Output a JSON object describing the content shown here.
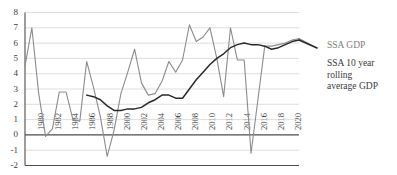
{
  "chart_data": {
    "type": "line",
    "title": "",
    "xlabel": "",
    "ylabel": "",
    "ylim": [
      -2,
      8
    ],
    "ytick_step": 1,
    "yticks": [
      8,
      7,
      6,
      5,
      4,
      3,
      2,
      1,
      0,
      -1,
      -2
    ],
    "xlim": [
      1980,
      2020
    ],
    "grid": true,
    "grid_axis": "y",
    "legend_position": "right",
    "x": [
      1980,
      1981,
      1982,
      1983,
      1984,
      1985,
      1986,
      1987,
      1988,
      1989,
      1990,
      1991,
      1992,
      1993,
      1994,
      1995,
      1996,
      1997,
      1998,
      1999,
      2000,
      2001,
      2002,
      2003,
      2004,
      2005,
      2006,
      2007,
      2008,
      2009,
      2010,
      2011,
      2012,
      2013,
      2014,
      2015,
      2016,
      2017,
      2018,
      2019,
      2020
    ],
    "xticks": [
      1980,
      1982,
      1984,
      1986,
      1988,
      2000,
      2002,
      2004,
      2006,
      2008,
      2010,
      2012,
      2014,
      2016,
      2018,
      2020
    ],
    "xtick_labels": [
      "1980",
      "1982",
      "1984",
      "1986",
      "1988",
      "2000",
      "2002",
      "2004",
      "2006",
      "2008",
      "2010",
      "2012",
      "2014",
      "2016",
      "2018",
      "2020"
    ],
    "series": [
      {
        "name": "SSA GDP",
        "color": "#8c8c8c",
        "width": 1.1,
        "values": [
          4.5,
          7.0,
          2.7,
          -0.1,
          0.4,
          2.8,
          2.8,
          1.0,
          0.9,
          4.8,
          3.1,
          1.2,
          -1.4,
          0.3,
          2.7,
          4.1,
          5.6,
          3.4,
          2.6,
          2.7,
          3.5,
          4.8,
          4.1,
          4.9,
          7.2,
          6.1,
          6.4,
          7.0,
          5.0,
          2.5,
          7.0,
          4.9,
          4.9,
          -1.2,
          2.3,
          5.8,
          5.8,
          5.9,
          6.0,
          6.2,
          6.3
        ]
      },
      {
        "name": "SSA 10 year rolling average GDP",
        "color": "#2a2a2a",
        "width": 1.5,
        "start_index": 9,
        "values": [
          null,
          null,
          null,
          null,
          null,
          null,
          null,
          null,
          null,
          2.6,
          2.5,
          2.3,
          1.9,
          1.6,
          1.6,
          1.7,
          1.7,
          1.8,
          2.1,
          2.3,
          2.6,
          2.6,
          2.4,
          2.4,
          3.0,
          3.6,
          4.1,
          4.6,
          5.0,
          5.3,
          5.7,
          5.9,
          6.0,
          5.9,
          5.9,
          5.8,
          5.6,
          5.7,
          5.9,
          6.1,
          6.2
        ]
      }
    ],
    "legend": [
      {
        "label": "SSA GDP",
        "color": "#8c8c8c"
      },
      {
        "label": "SSA 10 year rolling\naverage GDP",
        "color": "#2a2a2a"
      }
    ]
  },
  "axis": {
    "y_labels": [
      "8",
      "7",
      "6",
      "5",
      "4",
      "3",
      "2",
      "1",
      "0",
      "-1",
      "-2"
    ]
  },
  "colors": {
    "grid": "#d6d6d6",
    "axis": "#4d4d4d",
    "series_raw": "#8c8c8c",
    "series_rolling": "#2a2a2a",
    "text": "#3d3d3d"
  }
}
